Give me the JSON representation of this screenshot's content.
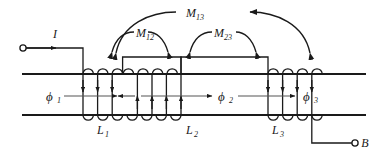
{
  "figure": {
    "kind": "magnetic-circuit-diagram",
    "line_color": "#1a1a1a",
    "background": "#ffffff"
  },
  "terminals": {
    "input": {
      "label": "I",
      "sub": ""
    },
    "output": {
      "label": "B",
      "sub": ""
    }
  },
  "coils": [
    {
      "name": "L",
      "sub": "1",
      "turns": 3,
      "arrow_direction": "down"
    },
    {
      "name": "L",
      "sub": "2",
      "turns": 4,
      "arrow_direction": "up"
    },
    {
      "name": "L",
      "sub": "3",
      "turns": 4,
      "arrow_direction": "down"
    }
  ],
  "fluxes": [
    {
      "name": "ϕ",
      "sub": "1",
      "arrow_direction": "right"
    },
    {
      "name": "ϕ",
      "sub": "2",
      "arrow_direction": "right"
    },
    {
      "name": "ϕ",
      "sub": "3",
      "arrow_direction": "right"
    }
  ],
  "flux_extra_arrow": {
    "direction": "left",
    "note": "leftward arrow at start of L2 section"
  },
  "mutual_inductances": [
    {
      "name": "M",
      "sub": "12",
      "span": "L1-L2",
      "arc": "inner-left"
    },
    {
      "name": "M",
      "sub": "23",
      "span": "L2-L3",
      "arc": "inner-right"
    },
    {
      "name": "M",
      "sub": "13",
      "span": "L1-L3",
      "arc": "outer"
    }
  ]
}
